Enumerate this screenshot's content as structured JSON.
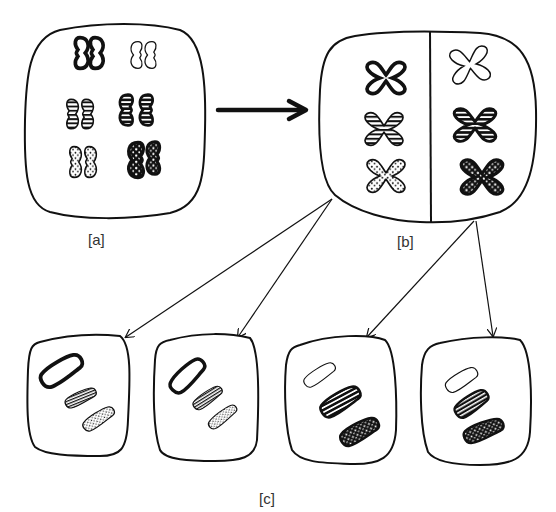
{
  "diagram": {
    "labels": {
      "a": "[a]",
      "b": "[b]",
      "c": "[c]"
    },
    "colors": {
      "ink": "#111111",
      "paper": "#ffffff",
      "label": "#333333"
    },
    "cells": [
      {
        "id": "a",
        "description": "Parent cell with 3 homologous pairs (6 unreplicated chromosomes)"
      },
      {
        "id": "b",
        "description": "Cell with replicated chromosomes, divided into two halves"
      },
      {
        "id": "c1",
        "description": "Daughter cell: dark-outline white, striped, dotted"
      },
      {
        "id": "c2",
        "description": "Daughter cell: dark-outline white, striped, dotted"
      },
      {
        "id": "c3",
        "description": "Daughter cell: thin white, black-striped, black-dotted"
      },
      {
        "id": "c4",
        "description": "Daughter cell: thin white, black-striped, black-dotted"
      }
    ],
    "chromosome_patterns": [
      "bold-outline-plain",
      "thin-outline-plain",
      "striped",
      "black-striped",
      "dotted",
      "black-dotted"
    ],
    "arrows": [
      {
        "from": "a",
        "to": "b",
        "style": "bold"
      },
      {
        "from": "b-left",
        "to": "c1",
        "style": "thin"
      },
      {
        "from": "b-left",
        "to": "c2",
        "style": "thin"
      },
      {
        "from": "b-right",
        "to": "c3",
        "style": "thin"
      },
      {
        "from": "b-right",
        "to": "c4",
        "style": "thin"
      }
    ]
  }
}
